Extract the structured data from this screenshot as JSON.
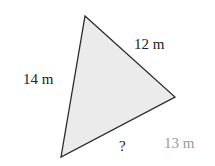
{
  "diagram": {
    "shape": "triangle",
    "fill": "#ebebeb",
    "stroke": "#2a2a2a",
    "vertices": {
      "top": [
        85,
        16
      ],
      "right": [
        175,
        97
      ],
      "bottom_left": [
        61,
        157
      ]
    },
    "labels": {
      "top_right_side": "12 m",
      "left_side": "14 m",
      "bottom_side": "?",
      "extra": "13 m"
    },
    "extra_label_color": "#9a9a9a"
  }
}
